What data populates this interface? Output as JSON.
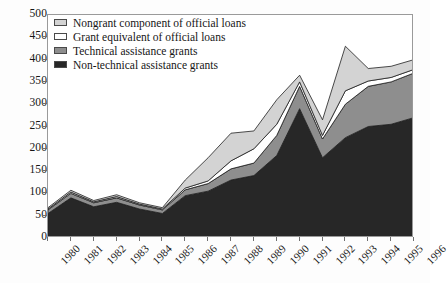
{
  "chart_data": {
    "type": "area",
    "stacked": true,
    "title": "",
    "xlabel": "",
    "ylabel": "",
    "ylim": [
      0,
      500
    ],
    "ytick_step": 50,
    "yticks": [
      0,
      50,
      100,
      150,
      200,
      250,
      300,
      350,
      400,
      450,
      500
    ],
    "grid": false,
    "legend_position": "top-left",
    "categories": [
      "1980",
      "1981",
      "1982",
      "1983",
      "1984",
      "1985",
      "1986",
      "1987",
      "1988",
      "1989",
      "1990",
      "1991",
      "1992",
      "1993",
      "1994",
      "1995",
      "1996"
    ],
    "series": [
      {
        "name": "Non-technical assistance grants",
        "color": "#272727",
        "values": [
          55,
          90,
          70,
          80,
          65,
          55,
          95,
          105,
          130,
          140,
          185,
          290,
          180,
          225,
          250,
          255,
          270
        ]
      },
      {
        "name": "Technical assistance grants",
        "color": "#8e8e8e",
        "values": [
          8,
          10,
          9,
          10,
          9,
          8,
          13,
          17,
          25,
          28,
          45,
          50,
          42,
          75,
          90,
          95,
          100
        ]
      },
      {
        "name": "Grant equivalent of official loans",
        "color": "#ffffff",
        "values": [
          2,
          3,
          2,
          3,
          2,
          2,
          4,
          6,
          18,
          32,
          25,
          10,
          8,
          30,
          12,
          10,
          8
        ]
      },
      {
        "name": "Nongrant component of official loans",
        "color": "#d3d3d3",
        "values": [
          3,
          4,
          3,
          4,
          3,
          3,
          18,
          52,
          62,
          40,
          55,
          15,
          35,
          100,
          28,
          25,
          22
        ]
      }
    ],
    "totals": [
      68,
      107,
      84,
      97,
      79,
      68,
      130,
      180,
      235,
      240,
      310,
      365,
      265,
      430,
      380,
      385,
      400
    ]
  },
  "legend": {
    "items": [
      {
        "label": "Nongrant component of official loans",
        "swatch": "#d3d3d3"
      },
      {
        "label": "Grant equivalent of official loans",
        "swatch": "#ffffff"
      },
      {
        "label": "Technical assistance grants",
        "swatch": "#8e8e8e"
      },
      {
        "label": "Non-technical assistance grants",
        "swatch": "#272727"
      }
    ]
  }
}
